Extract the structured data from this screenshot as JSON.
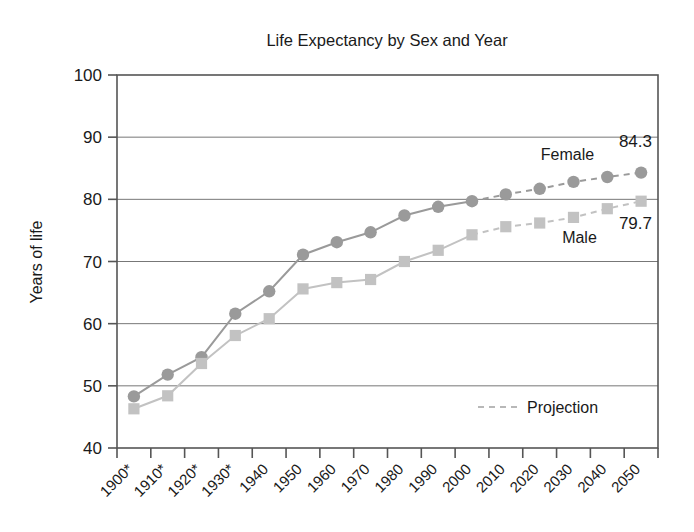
{
  "chart_data": {
    "type": "line",
    "title": "Life Expectancy by Sex and Year",
    "xlabel": "",
    "ylabel": "Years of life",
    "ylim": [
      40,
      100
    ],
    "yticks": [
      40,
      50,
      60,
      70,
      80,
      90,
      100
    ],
    "grid": true,
    "legend_position": "inside-bottom-right",
    "categories": [
      "1900*",
      "1910*",
      "1920*",
      "1930*",
      "1940",
      "1950",
      "1960",
      "1970",
      "1980",
      "1990",
      "2000",
      "2010",
      "2020",
      "2030",
      "2040",
      "2050"
    ],
    "series": [
      {
        "name": "Female",
        "marker": "circle",
        "color": "#9a9a9a",
        "values": [
          48.3,
          51.8,
          54.6,
          61.6,
          65.2,
          71.1,
          73.1,
          74.7,
          77.4,
          78.8,
          79.7,
          80.8,
          81.7,
          82.8,
          83.6,
          84.3
        ],
        "projection_from_index": 10,
        "end_label": "84.3"
      },
      {
        "name": "Male",
        "marker": "square",
        "color": "#c2c2c2",
        "values": [
          46.3,
          48.4,
          53.6,
          58.1,
          60.8,
          65.6,
          66.6,
          67.1,
          70.0,
          71.8,
          74.3,
          75.6,
          76.2,
          77.1,
          78.5,
          79.7
        ],
        "projection_from_index": 10,
        "end_label": "79.7"
      }
    ],
    "legend": [
      {
        "label": "Projection",
        "style": "dashed",
        "color": "#b8b8b8"
      }
    ],
    "annotations": [
      {
        "text": "Female",
        "series": "Female"
      },
      {
        "text": "Male",
        "series": "Male"
      },
      {
        "text": "84.3",
        "series": "Female"
      },
      {
        "text": "79.7",
        "series": "Male"
      }
    ]
  },
  "axis_colors": {
    "frame": "#555555",
    "grid": "#777777"
  }
}
